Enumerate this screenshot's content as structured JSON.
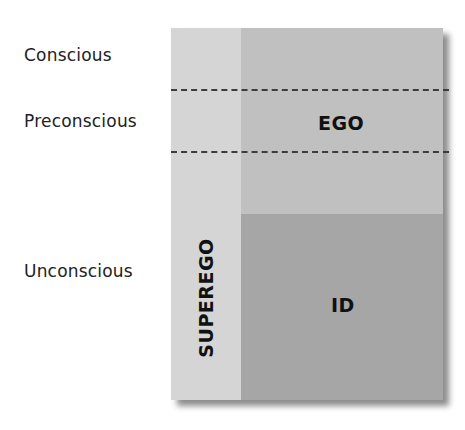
{
  "levels": {
    "conscious": "Conscious",
    "preconscious": "Preconscious",
    "unconscious": "Unconscious"
  },
  "regions": {
    "ego": "EGO",
    "id": "ID",
    "superego": "SUPEREGO"
  },
  "colors": {
    "superego": "#d5d5d5",
    "ego": "#c0c0c0",
    "id": "#a6a6a6",
    "dashed_line": "#3c3c3c"
  }
}
